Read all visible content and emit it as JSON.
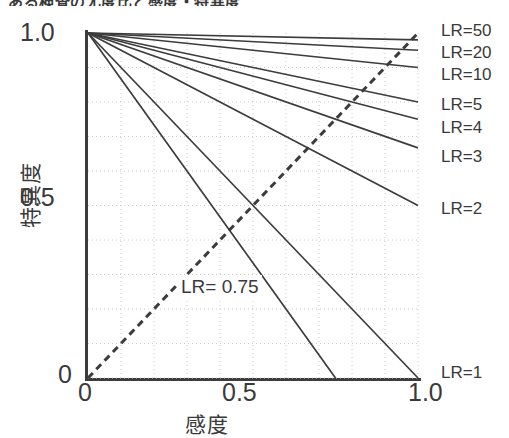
{
  "figure": {
    "top_caption": "ある検査の尤度比と感度・特異度",
    "background_color": "#ffffff",
    "line_color": "#3c3c3c",
    "grid_color": "#cccccc"
  },
  "axes": {
    "x": {
      "title": "感度",
      "ticks": [
        "0",
        "0.5",
        "1.0"
      ],
      "tick_values": [
        0,
        0.5,
        1.0
      ],
      "range": [
        0,
        1.0
      ]
    },
    "y": {
      "title": "特異度",
      "ticks": [
        "1.0",
        "0.5",
        "0"
      ],
      "tick_values": [
        1.0,
        0.5,
        0
      ],
      "range": [
        0,
        1.0
      ]
    }
  },
  "inline_labels": {
    "lr_075": "LR= 0.75"
  },
  "chart_data": {
    "type": "line",
    "title": "ある検査の尤度比と感度・特異度",
    "xlabel": "感度",
    "ylabel": "特異度",
    "xlim": [
      0,
      1.0
    ],
    "ylim": [
      0,
      1.0
    ],
    "grid": true,
    "grid_spacing": 0.1,
    "grid_style": "dotted",
    "legend_position": "right-of-line-ends",
    "series": [
      {
        "name": "LR=50",
        "label": "LR=50",
        "style": "solid",
        "lr": 50,
        "x": [
          0,
          1.0
        ],
        "y": [
          1.0,
          0.98
        ]
      },
      {
        "name": "LR=20",
        "label": "LR=20",
        "style": "solid",
        "lr": 20,
        "x": [
          0,
          1.0
        ],
        "y": [
          1.0,
          0.95
        ]
      },
      {
        "name": "LR=10",
        "label": "LR=10",
        "style": "solid",
        "lr": 10,
        "x": [
          0,
          1.0
        ],
        "y": [
          1.0,
          0.9
        ]
      },
      {
        "name": "LR=5",
        "label": "LR=5",
        "style": "solid",
        "lr": 5,
        "x": [
          0,
          1.0
        ],
        "y": [
          1.0,
          0.8
        ]
      },
      {
        "name": "LR=4",
        "label": "LR=4",
        "style": "solid",
        "lr": 4,
        "x": [
          0,
          1.0
        ],
        "y": [
          1.0,
          0.75
        ]
      },
      {
        "name": "LR=3",
        "label": "LR=3",
        "style": "solid",
        "lr": 3,
        "x": [
          0,
          1.0
        ],
        "y": [
          1.0,
          0.667
        ]
      },
      {
        "name": "LR=2",
        "label": "LR=2",
        "style": "solid",
        "lr": 2,
        "x": [
          0,
          1.0
        ],
        "y": [
          1.0,
          0.5
        ]
      },
      {
        "name": "LR=1.33",
        "label": "",
        "style": "solid",
        "lr": 1.33,
        "x": [
          0,
          0.75
        ],
        "y": [
          1.0,
          0
        ]
      },
      {
        "name": "LR=1",
        "label": "LR=1",
        "style": "solid",
        "lr": 1,
        "x": [
          0,
          1.0
        ],
        "y": [
          1.0,
          0
        ]
      },
      {
        "name": "LR= 0.75",
        "label": "LR= 0.75",
        "style": "dashed",
        "lr": 0.75,
        "x": [
          0,
          1.0
        ],
        "y": [
          0,
          1.0
        ]
      }
    ]
  },
  "curve_labels": [
    {
      "text": "LR=50",
      "left": 441,
      "top": 22
    },
    {
      "text": "LR=20",
      "left": 441,
      "top": 44
    },
    {
      "text": "LR=10",
      "left": 441,
      "top": 66
    },
    {
      "text": "LR=5",
      "left": 441,
      "top": 96
    },
    {
      "text": "LR=4",
      "left": 441,
      "top": 119
    },
    {
      "text": "LR=3",
      "left": 441,
      "top": 148
    },
    {
      "text": "LR=2",
      "left": 441,
      "top": 200
    },
    {
      "text": "LR=1",
      "left": 441,
      "top": 364
    }
  ]
}
